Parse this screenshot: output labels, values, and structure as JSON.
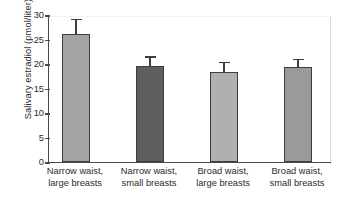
{
  "chart_data": {
    "type": "bar",
    "title": "",
    "xlabel": "",
    "ylabel": "Salivary estradiol (pmol/liter)",
    "ylim": [
      0,
      30
    ],
    "ytick_values": [
      0,
      5,
      10,
      15,
      20,
      25,
      30
    ],
    "ytick_labels": [
      "0",
      "5",
      "10",
      "15",
      "20",
      "25",
      "30"
    ],
    "grid": false,
    "legend": "none",
    "categories": [
      "Narrow waist, large breasts",
      "Narrow waist, small breasts",
      "Broad waist, large breasts",
      "Broad waist, small breasts"
    ],
    "category_lines": [
      [
        "Narrow waist,",
        "large breasts"
      ],
      [
        "Narrow waist,",
        "small breasts"
      ],
      [
        "Broad waist,",
        "large breasts"
      ],
      [
        "Broad waist,",
        "small breasts"
      ]
    ],
    "values": [
      26.1,
      19.5,
      18.4,
      19.4
    ],
    "errors_upper": [
      3.3,
      2.3,
      2.3,
      1.9
    ],
    "error_tops": [
      29.4,
      21.8,
      20.7,
      21.3
    ],
    "bar_colors": [
      "#a3a3a3",
      "#5f5f5f",
      "#b0b0b0",
      "#9a9a9a"
    ],
    "bar_edge_color": "#3d3d3d",
    "error_color": "#3d3d3d",
    "axis_color": "#4a4a4a",
    "background": "#ffffff"
  },
  "bars": [
    {
      "label": "Narrow waist, large breasts",
      "value": 26.1,
      "error_top": 29.4,
      "color": "#a3a3a3",
      "left_px": 61,
      "width_px": 28
    },
    {
      "label": "Narrow waist, small breasts",
      "value": 19.5,
      "error_top": 21.8,
      "color": "#5f5f5f",
      "left_px": 135,
      "width_px": 28
    },
    {
      "label": "Broad waist, large breasts",
      "value": 18.4,
      "error_top": 20.7,
      "color": "#b0b0b0",
      "left_px": 209,
      "width_px": 28
    },
    {
      "label": "Broad waist, small breasts",
      "value": 19.4,
      "error_top": 21.3,
      "color": "#9a9a9a",
      "left_px": 283,
      "width_px": 28
    }
  ]
}
